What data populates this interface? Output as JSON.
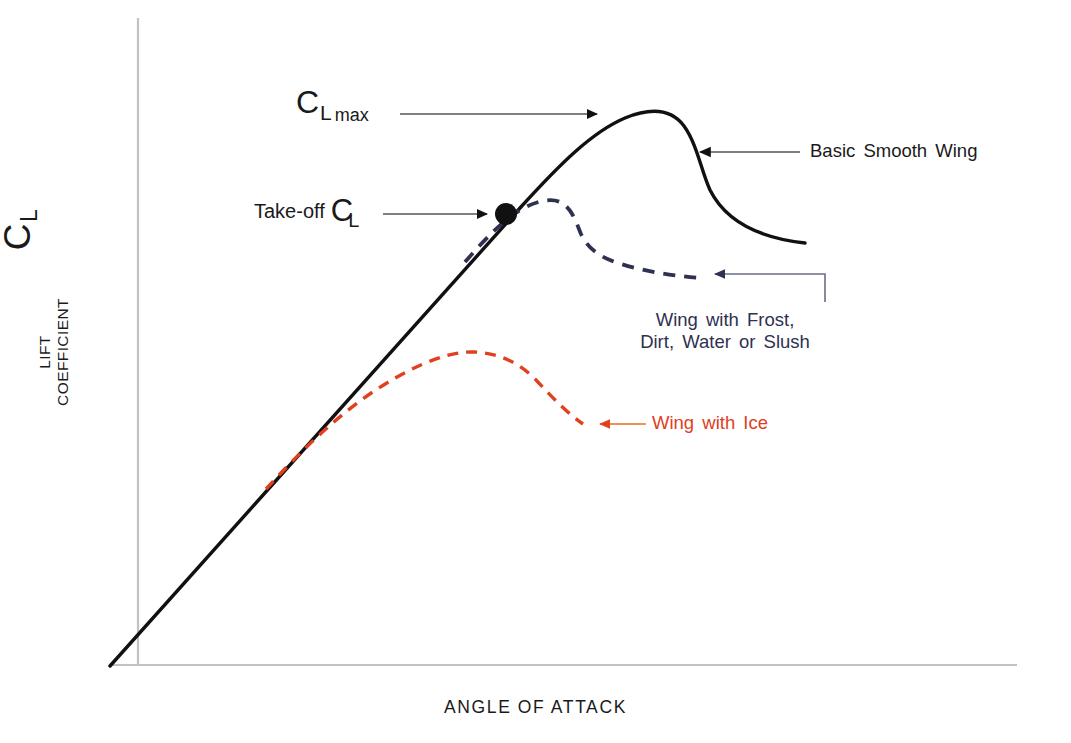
{
  "figure": {
    "background": "#ffffff",
    "width": 1071,
    "height": 743
  },
  "axes": {
    "y_symbol_main": "C",
    "y_symbol_sub": "L",
    "y_name_line1": "LIFT",
    "y_name_line2": "COEFFICIENT",
    "x_name": "ANGLE OF ATTACK",
    "axis_color": "#bfbfbf"
  },
  "annotations": {
    "cl_max": {
      "main": "C",
      "sub_l": "L",
      "sub_max": "max",
      "arrow_direction": "right",
      "color": "#1a1a1a"
    },
    "take_off": {
      "prefix": "Take-off",
      "main": "C",
      "sub_l": "L",
      "arrow_direction": "right",
      "color": "#1a1a1a"
    },
    "basic_smooth_wing": {
      "text": "Basic Smooth Wing",
      "arrow_direction": "left",
      "color": "#1a1a1a"
    },
    "frost": {
      "line1": "Wing with Frost,",
      "line2": "Dirt, Water or Slush",
      "arrow_direction": "left",
      "color": "#2e3150"
    },
    "ice": {
      "text": "Wing with Ice",
      "arrow_direction": "left",
      "color": "#e0401e"
    }
  },
  "chart_data": {
    "type": "line",
    "title": "",
    "xlabel": "ANGLE OF ATTACK",
    "ylabel": "LIFT COEFFICIENT",
    "axis_ticks": "none",
    "grid": false,
    "legend": "annotations",
    "xlim": [
      0,
      1
    ],
    "ylim": [
      0,
      1
    ],
    "series": [
      {
        "name": "Basic Smooth Wing",
        "style": "solid",
        "color": "#111111",
        "width": 3.2,
        "path": "M 110 666 L 520 208 C 560 164 592 132 625 118 C 652 107 672 110 684 126 C 697 144 701 170 710 190 C 726 222 760 238 805 243",
        "description": "Straight linear lift slope to stall peak (C_L max) then sharp drop and gradual taper"
      },
      {
        "name": "Wing with Frost, Dirt, Water or Slush",
        "style": "dashed",
        "color": "#2e3150",
        "width": 3.6,
        "dash": "12 9",
        "path": "M 465 262 C 486 238 500 224 514 214 C 530 203 548 197 560 202 C 572 208 576 222 581 234 C 588 249 600 257 618 263 C 646 272 676 276 700 278",
        "description": "Degraded curve branching off linear slope just below take-off point, lower peak, earlier stall"
      },
      {
        "name": "Wing with Ice",
        "style": "dashed",
        "color": "#e0401e",
        "width": 3.2,
        "dash": "11 8",
        "path": "M 266 489 C 300 452 340 412 382 386 C 420 362 452 351 474 352 C 500 353 521 364 537 381 C 553 398 568 414 583 424",
        "description": "Severely degraded curve, lowest and earliest peak, shallow broad stall"
      }
    ],
    "markers": [
      {
        "name": "take-off-point",
        "x": 506,
        "y": 214,
        "radius": 11,
        "color": "#111111",
        "label": "Take-off C_L"
      }
    ],
    "key_points": {
      "cl_max_peak": [
        648,
        114
      ],
      "frost_peak": [
        556,
        199
      ],
      "ice_peak": [
        472,
        352
      ],
      "take_off": [
        506,
        214
      ]
    }
  }
}
